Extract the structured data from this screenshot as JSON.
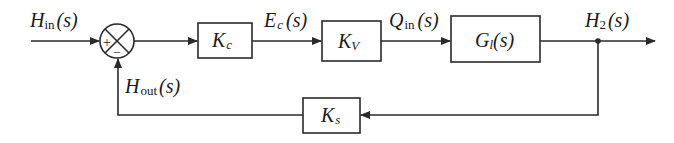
{
  "diagram": {
    "type": "feedback-control-block-diagram",
    "colors": {
      "line": "#2a2a2a",
      "text": "#1a1a1a",
      "background": "#ffffff"
    },
    "signals": {
      "input": {
        "main": "H",
        "sub": "in",
        "arg": "(s)"
      },
      "error": {
        "main": "E",
        "sub": "c",
        "arg": "(s)"
      },
      "flow": {
        "main": "Q",
        "sub": "in",
        "arg": "(s)"
      },
      "output": {
        "main": "H",
        "sub": "2",
        "arg": "(s)"
      },
      "feedback": {
        "main": "H",
        "sub": "out",
        "arg": "(s)"
      }
    },
    "summing_junction": {
      "plus": "+",
      "minus": "−"
    },
    "blocks": {
      "controller": {
        "main": "K",
        "sub": "c"
      },
      "valve": {
        "main": "K",
        "sub": "V"
      },
      "plant": {
        "main": "G",
        "sub": "l",
        "arg": "(s)"
      },
      "sensor": {
        "main": "K",
        "sub": "s"
      }
    }
  }
}
